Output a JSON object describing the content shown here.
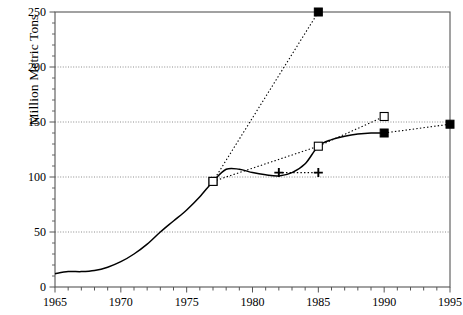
{
  "chart_data": {
    "type": "line",
    "title": "",
    "xlabel": "",
    "ylabel": "Million Metric Tons",
    "xlim": [
      1965,
      1995
    ],
    "ylim": [
      0,
      250
    ],
    "grid": true,
    "grid_axis": "y",
    "legend": "none",
    "xticks": [
      1965,
      1970,
      1975,
      1980,
      1985,
      1990,
      1995
    ],
    "xtick_labels": [
      "1965",
      "1970",
      "1975",
      "1980",
      "1985",
      "1990",
      "1995"
    ],
    "xminor_interval": 1,
    "yticks": [
      0,
      50,
      100,
      150,
      200,
      250
    ],
    "ytick_labels": [
      "0",
      "50",
      "100",
      "150",
      "200",
      "250"
    ],
    "series": [
      {
        "name": "historical-actual",
        "style": "solid",
        "marker": "none",
        "color": "#000000",
        "x": [
          1965,
          1966,
          1967,
          1968,
          1969,
          1970,
          1971,
          1972,
          1973,
          1974,
          1975,
          1976,
          1977,
          1978,
          1979,
          1980,
          1981,
          1982,
          1983,
          1984,
          1985,
          1986,
          1987,
          1988,
          1989,
          1990
        ],
        "values": [
          12,
          14,
          14,
          15,
          18,
          23,
          30,
          39,
          50,
          60,
          70,
          82,
          96,
          107,
          107,
          104,
          102,
          101,
          104,
          112,
          128,
          134,
          137,
          139,
          140,
          140
        ]
      },
      {
        "name": "high-projection-filled-square",
        "style": "dotted",
        "marker": "filled-square",
        "color": "#000000",
        "x": [
          1977,
          1985
        ],
        "values": [
          96,
          250
        ]
      },
      {
        "name": "mid-projection-open-square",
        "style": "dotted",
        "marker": "open-square",
        "color": "#000000",
        "x": [
          1977,
          1985,
          1990
        ],
        "values": [
          96,
          128,
          155
        ]
      },
      {
        "name": "flat-projection-plus",
        "style": "dotted",
        "marker": "plus",
        "color": "#000000",
        "x": [
          1982,
          1985
        ],
        "values": [
          104,
          104
        ]
      },
      {
        "name": "late-projection-filled-square",
        "style": "dotted",
        "marker": "filled-square",
        "color": "#000000",
        "x": [
          1990,
          1995
        ],
        "values": [
          140,
          148
        ]
      }
    ],
    "colors": {
      "axis": "#555555",
      "grid": "#808080",
      "data": "#000000",
      "background": "#ffffff"
    }
  }
}
